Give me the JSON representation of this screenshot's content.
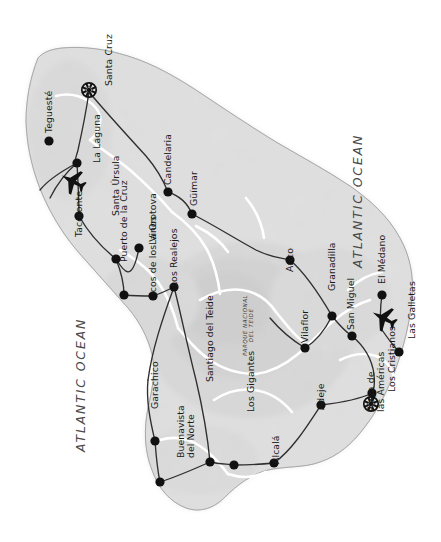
{
  "map": {
    "title": "Tenerife",
    "colors": {
      "water": "#ffffff",
      "land": "#dcdcdc",
      "land_shade": "#c9c9c9",
      "coastline": "#8a8a8a",
      "road_main": "#3a3a3a",
      "road_minor": "#ffffff",
      "marker": "#111111",
      "text": "#1a1a1a",
      "ocean_text": "#4a4a4a"
    },
    "ocean_labels": [
      {
        "text": "ATLANTIC OCEAN",
        "x": 352,
        "y": 268,
        "name": "ocean-label-northeast"
      },
      {
        "text": "ATLANTIC OCEAN",
        "x": 75,
        "y": 452,
        "name": "ocean-label-southwest"
      }
    ],
    "park_label": {
      "line1": "PARQUE NACIONAL",
      "line2": "DEL TEIDE",
      "x": 242,
      "y": 356
    },
    "capital": {
      "label": "Santa Cruz",
      "icon": "star-capital-icon",
      "dot_x": 89,
      "dot_y": 90,
      "label_x": 104,
      "label_y": 86
    },
    "resort_star": {
      "label_line1": "Playa de",
      "label_line2": "las Américas",
      "icon": "star-capital-icon",
      "dot_x": 371,
      "dot_y": 404,
      "label_x": 366,
      "label_y": 412
    },
    "airports": [
      {
        "name": "airport-north-icon",
        "x": 72,
        "y": 181,
        "rot": -62
      },
      {
        "name": "airport-south-icon",
        "x": 383,
        "y": 318,
        "rot": -62
      }
    ],
    "towns": [
      {
        "label": "Teguesté",
        "dot_x": 49,
        "dot_y": 141,
        "label_x": 44,
        "label_y": 133
      },
      {
        "label": "La Laguna",
        "dot_x": 77,
        "dot_y": 163,
        "label_x": 92,
        "label_y": 163
      },
      {
        "label": "Candelaria",
        "dot_x": 168,
        "dot_y": 192,
        "label_x": 163,
        "label_y": 185
      },
      {
        "label": "Güímar",
        "dot_x": 192,
        "dot_y": 214,
        "label_x": 189,
        "label_y": 206
      },
      {
        "label": "Tacoronte",
        "dot_x": 79,
        "dot_y": 216,
        "label_x": 74,
        "label_y": 237
      },
      {
        "label": "Santa Úrsula",
        "dot_x": 116,
        "dot_y": 259,
        "label_x": 111,
        "label_y": 216
      },
      {
        "label": "La Orotova",
        "dot_x": 139,
        "dot_y": 248,
        "label_x": 148,
        "label_y": 245
      },
      {
        "label": "Puerto de la Cruz",
        "dot_x": 124,
        "dot_y": 295,
        "label_x": 119,
        "label_y": 262
      },
      {
        "label": "Icos de los Vinos",
        "dot_x": 153,
        "dot_y": 296,
        "label_x": 148,
        "label_y": 295
      },
      {
        "label": "Los Realejos",
        "dot_x": 174,
        "dot_y": 287,
        "label_x": 169,
        "label_y": 287
      },
      {
        "label": "Garachico",
        "dot_x": 155,
        "dot_y": 441,
        "label_x": 150,
        "label_y": 409
      },
      {
        "label": "Buenavista",
        "label2": "del Norte",
        "dot_x": 160,
        "dot_y": 482,
        "label_x": 176,
        "label_y": 458
      },
      {
        "label": "Santiago del Teide",
        "dot_x": 210,
        "dot_y": 462,
        "label_x": 205,
        "label_y": 382
      },
      {
        "label": "Los Gigantes",
        "dot_x": 234,
        "dot_y": 465,
        "label_x": 246,
        "label_y": 412
      },
      {
        "label": "Alcalá",
        "dot_x": 274,
        "dot_y": 463,
        "label_x": 271,
        "label_y": 464
      },
      {
        "label": "Adeje",
        "dot_x": 321,
        "dot_y": 405,
        "label_x": 316,
        "label_y": 410
      },
      {
        "label": "Los Cristianos",
        "dot_x": 372,
        "dot_y": 393,
        "label_x": 387,
        "label_y": 392
      },
      {
        "label": "Las Galletas",
        "dot_x": 399,
        "dot_y": 352,
        "label_x": 407,
        "label_y": 339
      },
      {
        "label": "El Médano",
        "dot_x": 382,
        "dot_y": 295,
        "label_x": 377,
        "label_y": 284
      },
      {
        "label": "San Miguel",
        "dot_x": 352,
        "dot_y": 336,
        "label_x": 346,
        "label_y": 330
      },
      {
        "label": "Granadilla",
        "dot_x": 332,
        "dot_y": 316,
        "label_x": 327,
        "label_y": 291
      },
      {
        "label": "Vilaflor",
        "dot_x": 305,
        "dot_y": 348,
        "label_x": 300,
        "label_y": 343
      },
      {
        "label": "Arico",
        "dot_x": 290,
        "dot_y": 260,
        "label_x": 285,
        "label_y": 272
      }
    ]
  }
}
